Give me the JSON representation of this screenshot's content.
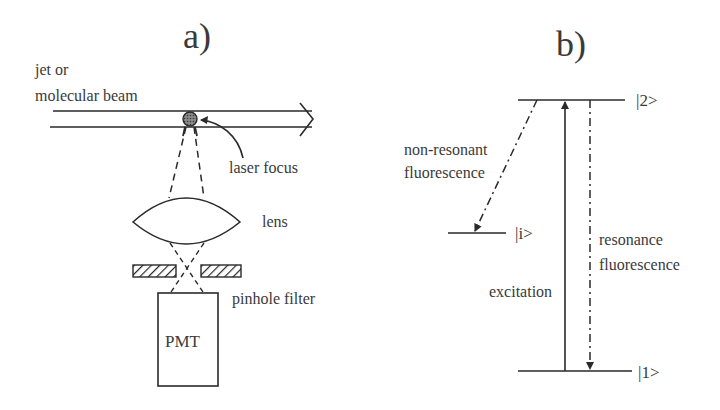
{
  "figure": {
    "panel_a": {
      "label": "a)",
      "beam_label_line1": "jet or",
      "beam_label_line2": "molecular beam",
      "focus_label": "laser focus",
      "lens_label": "lens",
      "pinhole_label": "pinhole filter",
      "detector_label": "PMT"
    },
    "panel_b": {
      "label": "b)",
      "levels": [
        {
          "name": "upper",
          "label": "|2>"
        },
        {
          "name": "intermediate",
          "label": "|i>"
        },
        {
          "name": "ground",
          "label": "|1>"
        }
      ],
      "transitions": {
        "non_resonant_line1": "non-resonant",
        "non_resonant_line2": "fluorescence",
        "excitation": "excitation",
        "resonance_line1": "resonance",
        "resonance_line2": "fluorescence"
      }
    }
  }
}
